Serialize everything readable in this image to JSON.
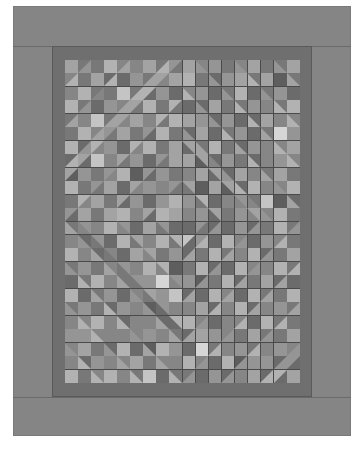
{
  "image": {
    "subject": "quilt-pattern",
    "style": "concentric diamond rings (barn raising)",
    "colors": {
      "outer_border": "#858585",
      "inner_border": "#6f6f6f",
      "grid_line": "#4a4a4a",
      "palette": [
        "#5e5e5e",
        "#6b6b6b",
        "#787878",
        "#868686",
        "#959595",
        "#a3a3a3",
        "#b2b2b2",
        "#c4c4c4",
        "#d6d6d6"
      ]
    },
    "grid": {
      "columns": 18,
      "rows": 24,
      "cell_width": 13.06,
      "cell_height": 13.46,
      "center_col": 8.9,
      "center_row": 12.2
    },
    "rings": [
      {
        "band": 0,
        "tone": "mid-dark"
      },
      {
        "band": 1,
        "tone": "light"
      },
      {
        "band": 2,
        "tone": "dark"
      },
      {
        "band": 3,
        "tone": "light"
      },
      {
        "band": 4,
        "tone": "dark"
      },
      {
        "band": 5,
        "tone": "light"
      },
      {
        "band": 6,
        "tone": "dark"
      },
      {
        "band": 7,
        "tone": "light"
      }
    ]
  }
}
